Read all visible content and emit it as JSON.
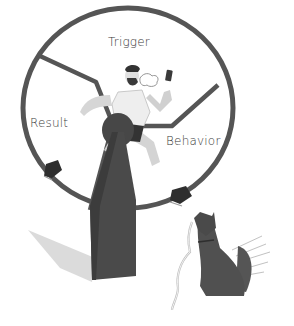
{
  "illustration": {
    "description": "Habit loop hamster wheel",
    "labels": {
      "trigger": "Trigger",
      "result": "Result",
      "behavior": "Behavior"
    },
    "colors": {
      "rim": "#555555",
      "stand": "#4a4a4a",
      "dog": "#4f4f4f",
      "shadow": "#c8c8c8",
      "skin": "#d9d9d9",
      "background": "#ffffff"
    }
  }
}
